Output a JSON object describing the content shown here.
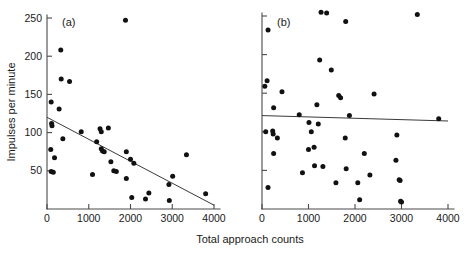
{
  "figure": {
    "xlabel": "Total approach counts",
    "ylabel": "Impulses per minute",
    "panel_a_label": "(a)",
    "panel_b_label": "(b)",
    "point_color": "#111111",
    "axis_color": "#4a4a4a",
    "line_color": "#3a3a3a"
  },
  "chart_data": [
    {
      "type": "scatter",
      "panel": "(a)",
      "title": "",
      "xlabel": "Total approach counts",
      "ylabel": "Impulses per minute",
      "xlim": [
        0,
        4000
      ],
      "ylim": [
        0,
        250
      ],
      "xticks": [
        0,
        1000,
        2000,
        3000,
        4000
      ],
      "xticklabels": [
        "0",
        "1000",
        "2000",
        "3000",
        "4000"
      ],
      "yticks": [
        50,
        100,
        150,
        200,
        250
      ],
      "yticklabels": [
        "50",
        "100",
        "150",
        "200",
        "250"
      ],
      "grid": false,
      "legend": null,
      "points": [
        [
          1880,
          247
        ],
        [
          330,
          208
        ],
        [
          340,
          170
        ],
        [
          540,
          167
        ],
        [
          100,
          140
        ],
        [
          290,
          131
        ],
        [
          110,
          112
        ],
        [
          120,
          109
        ],
        [
          380,
          92
        ],
        [
          820,
          101
        ],
        [
          1270,
          105
        ],
        [
          1300,
          101
        ],
        [
          1470,
          106
        ],
        [
          1190,
          88
        ],
        [
          1300,
          79
        ],
        [
          1330,
          76
        ],
        [
          1370,
          75
        ],
        [
          1090,
          45
        ],
        [
          90,
          78
        ],
        [
          180,
          67
        ],
        [
          100,
          49
        ],
        [
          150,
          48
        ],
        [
          1530,
          62
        ],
        [
          1600,
          50
        ],
        [
          1660,
          49
        ],
        [
          1900,
          75
        ],
        [
          2000,
          65
        ],
        [
          2080,
          60
        ],
        [
          1900,
          40
        ],
        [
          3340,
          71
        ],
        [
          2920,
          32
        ],
        [
          3010,
          43
        ],
        [
          2030,
          15
        ],
        [
          2360,
          13
        ],
        [
          2440,
          21
        ],
        [
          2930,
          11
        ],
        [
          3800,
          20
        ]
      ],
      "trendline": {
        "x": [
          0,
          4000
        ],
        "y": [
          120,
          5
        ],
        "description": "negative-slope regression line"
      }
    },
    {
      "type": "scatter",
      "panel": "(b)",
      "title": "",
      "xlabel": "Total approach counts",
      "ylabel": "Impulses per minute",
      "xlim": [
        0,
        4000
      ],
      "ylim": [
        0,
        250
      ],
      "xticks": [
        0,
        1000,
        2000,
        3000,
        4000
      ],
      "xticklabels": [
        "0",
        "1000",
        "2000",
        "3000",
        "4000"
      ],
      "yticks": [
        50,
        100,
        150,
        200,
        250
      ],
      "yticklabels": [
        "",
        "",
        "",
        "",
        ""
      ],
      "grid": false,
      "legend": null,
      "points": [
        [
          1270,
          255
        ],
        [
          1390,
          254
        ],
        [
          3340,
          252
        ],
        [
          1800,
          243
        ],
        [
          130,
          232
        ],
        [
          1240,
          193
        ],
        [
          1490,
          180
        ],
        [
          110,
          166
        ],
        [
          60,
          159
        ],
        [
          430,
          152
        ],
        [
          1650,
          147
        ],
        [
          1690,
          144
        ],
        [
          2410,
          149
        ],
        [
          1180,
          135
        ],
        [
          250,
          131
        ],
        [
          1210,
          110
        ],
        [
          800,
          122
        ],
        [
          1880,
          121
        ],
        [
          3800,
          117
        ],
        [
          1010,
          112
        ],
        [
          80,
          100
        ],
        [
          230,
          101
        ],
        [
          240,
          97
        ],
        [
          1060,
          100
        ],
        [
          2900,
          96
        ],
        [
          330,
          92
        ],
        [
          1790,
          92
        ],
        [
          1120,
          80
        ],
        [
          1000,
          77
        ],
        [
          250,
          72
        ],
        [
          2200,
          72
        ],
        [
          2880,
          63
        ],
        [
          1130,
          56
        ],
        [
          1310,
          55
        ],
        [
          1810,
          52
        ],
        [
          870,
          47
        ],
        [
          2320,
          44
        ],
        [
          2950,
          38
        ],
        [
          2970,
          37
        ],
        [
          1590,
          34
        ],
        [
          2060,
          34
        ],
        [
          130,
          28
        ],
        [
          2100,
          12
        ],
        [
          2980,
          10
        ],
        [
          3000,
          9
        ]
      ],
      "trendline": {
        "x": [
          0,
          4000
        ],
        "y": [
          121,
          114
        ],
        "description": "nearly flat regression line"
      }
    }
  ]
}
